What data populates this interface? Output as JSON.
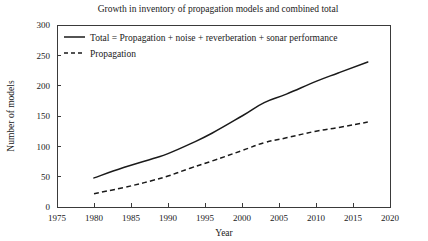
{
  "chart_data": {
    "type": "line",
    "title": "Growth in inventory of propagation models and combined total",
    "xlabel": "Year",
    "ylabel": "Number of models",
    "xlim": [
      1975,
      2020
    ],
    "ylim": [
      0,
      300
    ],
    "xticks": [
      1975,
      1980,
      1985,
      1990,
      1995,
      2000,
      2005,
      2010,
      2015,
      2020
    ],
    "yticks": [
      0,
      50,
      100,
      150,
      200,
      250,
      300
    ],
    "grid": false,
    "legend_position": "top-left",
    "series": [
      {
        "name": "Total = Propagation + noise + reverberation + sonar performance",
        "style": "solid",
        "color": "#1a1a1a",
        "x": [
          1980,
          1984,
          1988,
          1990,
          1993,
          1996,
          2000,
          2003,
          2006,
          2010,
          2013,
          2017
        ],
        "values": [
          48,
          65,
          80,
          88,
          104,
          122,
          150,
          172,
          186,
          207,
          221,
          239
        ]
      },
      {
        "name": "Propagation",
        "style": "dashed",
        "color": "#1a1a1a",
        "x": [
          1980,
          1984,
          1988,
          1990,
          1993,
          1996,
          2000,
          2003,
          2006,
          2010,
          2013,
          2017
        ],
        "values": [
          22,
          32,
          44,
          51,
          64,
          76,
          93,
          106,
          114,
          125,
          131,
          140
        ]
      }
    ]
  },
  "legend": {
    "entries": [
      {
        "label": "Total = Propagation + noise + reverberation + sonar performance"
      },
      {
        "label": "Propagation"
      }
    ]
  },
  "axes": {
    "x_tick_labels": [
      "1975",
      "1980",
      "1985",
      "1990",
      "1995",
      "2000",
      "2005",
      "2010",
      "2015",
      "2020"
    ],
    "y_tick_labels": [
      "0",
      "50",
      "100",
      "150",
      "200",
      "250",
      "300"
    ]
  }
}
